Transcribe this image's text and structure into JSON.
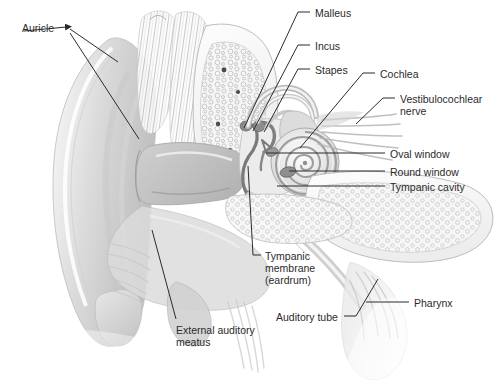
{
  "figure": {
    "background_color": "#ffffff",
    "ink_color": "#2b2b2b",
    "width": 499,
    "height": 386
  },
  "labels": [
    {
      "id": "auricle",
      "text": "Auricle",
      "x": 22,
      "y": 22,
      "align": "left"
    },
    {
      "id": "malleus",
      "text": "Malleus",
      "x": 315,
      "y": 7,
      "align": "left"
    },
    {
      "id": "incus",
      "text": "Incus",
      "x": 315,
      "y": 40,
      "align": "left"
    },
    {
      "id": "stapes",
      "text": "Stapes",
      "x": 315,
      "y": 64,
      "align": "left"
    },
    {
      "id": "cochlea",
      "text": "Cochlea",
      "x": 380,
      "y": 68,
      "align": "left"
    },
    {
      "id": "vestibulocochlear",
      "text": "Vestibulocochlear",
      "x": 400,
      "y": 93,
      "align": "left"
    },
    {
      "id": "vestibulocochlear_2",
      "text": "nerve",
      "x": 400,
      "y": 105,
      "align": "left"
    },
    {
      "id": "oval_window",
      "text": "Oval window",
      "x": 390,
      "y": 148,
      "align": "left"
    },
    {
      "id": "round_window",
      "text": "Round window",
      "x": 390,
      "y": 166,
      "align": "left"
    },
    {
      "id": "tympanic_cavity",
      "text": "Tympanic cavity",
      "x": 390,
      "y": 181,
      "align": "left"
    },
    {
      "id": "pharynx",
      "text": "Pharynx",
      "x": 414,
      "y": 297,
      "align": "left"
    },
    {
      "id": "tympanic_membrane",
      "text": "Tympanic",
      "x": 265,
      "y": 250,
      "align": "left"
    },
    {
      "id": "tympanic_membrane_2",
      "text": "membrane",
      "x": 265,
      "y": 262,
      "align": "left"
    },
    {
      "id": "tympanic_membrane_3",
      "text": "(eardrum)",
      "x": 265,
      "y": 274,
      "align": "left"
    },
    {
      "id": "auditory_tube",
      "text": "Auditory tube",
      "x": 276,
      "y": 311,
      "align": "left"
    },
    {
      "id": "external_meatus",
      "text": "External auditory",
      "x": 176,
      "y": 324,
      "align": "left"
    },
    {
      "id": "external_meatus_2",
      "text": "meatus",
      "x": 176,
      "y": 336,
      "align": "left"
    }
  ],
  "leaders": [
    {
      "id": "leader-auricle-a",
      "points": "70,29 118,62",
      "arrow": "none"
    },
    {
      "id": "leader-auricle-arrow",
      "points": "66,27 24,31",
      "arrow": "start"
    },
    {
      "id": "leader-auricle-b",
      "points": "70,33 139,139",
      "arrow": "none"
    },
    {
      "id": "leader-malleus",
      "points": "310,12 298,12 244,128",
      "arrow": "none"
    },
    {
      "id": "leader-incus",
      "points": "310,45 298,45 253,131",
      "arrow": "none"
    },
    {
      "id": "leader-stapes",
      "points": "310,69 298,69 264,132",
      "arrow": "none"
    },
    {
      "id": "leader-cochlea",
      "points": "375,73 363,73 300,148",
      "arrow": "none"
    },
    {
      "id": "leader-vestibulocochlear",
      "points": "395,98 383,98 356,124",
      "arrow": "none"
    },
    {
      "id": "leader-oval-window",
      "points": "385,153 266,153",
      "arrow": "none"
    },
    {
      "id": "leader-round-window",
      "points": "385,171 289,171",
      "arrow": "none"
    },
    {
      "id": "leader-tympanic-cavity",
      "points": "385,186 277,186",
      "arrow": "none"
    },
    {
      "id": "leader-pharynx",
      "points": "409,302 366,302",
      "arrow": "none"
    },
    {
      "id": "leader-tympanic-membrane",
      "points": "261,255 253,255 248,166",
      "arrow": "none"
    },
    {
      "id": "leader-auditory-tube",
      "points": "344,316 356,316 378,279",
      "arrow": "none"
    },
    {
      "id": "leader-external-meatus",
      "points": "176,319 152,230",
      "arrow": "none"
    }
  ],
  "anatomy": {
    "parts": [
      "auricle-pinna",
      "external-auditory-meatus",
      "tympanic-membrane",
      "malleus",
      "incus",
      "stapes",
      "oval-window",
      "round-window",
      "tympanic-cavity",
      "cochlea",
      "semicircular-canals",
      "vestibulocochlear-nerve",
      "auditory-tube",
      "pharynx",
      "temporal-bone"
    ],
    "palette": {
      "bone_fill": "#f3f3f3",
      "bone_outline": "#b9b9b9",
      "cartilage": "#d9d9d9",
      "soft_tissue": "#c9c9c9",
      "cavity": "#e8e8e8",
      "shadow": "#a8a8a8",
      "line": "#2b2b2b"
    }
  }
}
